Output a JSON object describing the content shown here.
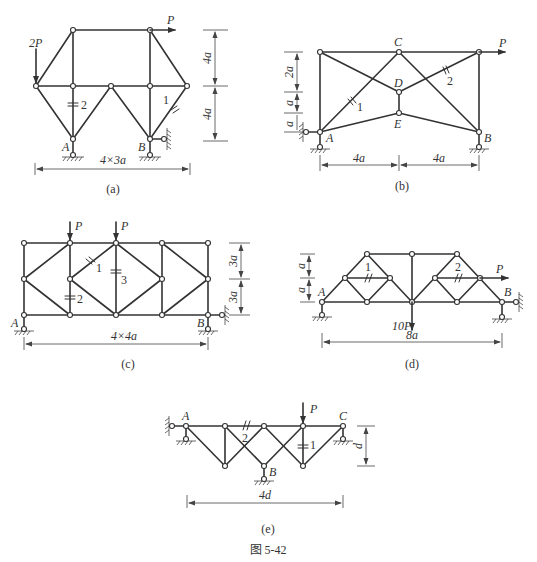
{
  "figure": {
    "caption": "图 5-42",
    "panels": [
      {
        "id": "a",
        "caption": "(a)",
        "labels": {
          "support_A": "A",
          "support_B": "B",
          "load_left": "2P",
          "load_top": "P",
          "member_1": "1",
          "member_2": "2"
        },
        "dimensions": {
          "span": "4×3a",
          "height_upper": "4a",
          "height_lower": "4a"
        }
      },
      {
        "id": "b",
        "caption": "(b)",
        "labels": {
          "support_A": "A",
          "support_B": "B",
          "node_C": "C",
          "node_D": "D",
          "node_E": "E",
          "load": "P",
          "member_1": "1",
          "member_2": "2"
        },
        "dimensions": {
          "left_span": "4a",
          "right_span": "4a",
          "h1": "2a",
          "h2": "a",
          "h3": "a"
        }
      },
      {
        "id": "c",
        "caption": "(c)",
        "labels": {
          "support_A": "A",
          "support_B": "B",
          "load_1": "P",
          "load_2": "P",
          "member_1": "1",
          "member_2": "2",
          "member_3": "3"
        },
        "dimensions": {
          "span": "4×4a",
          "h_upper": "3a",
          "h_lower": "3a"
        }
      },
      {
        "id": "d",
        "caption": "(d)",
        "labels": {
          "support_A": "A",
          "support_B": "B",
          "load_down": "10P",
          "load_right": "P",
          "member_1": "1",
          "member_2": "2"
        },
        "dimensions": {
          "span": "8a",
          "h_upper": "a",
          "h_lower": "a"
        }
      },
      {
        "id": "e",
        "caption": "(e)",
        "labels": {
          "support_A": "A",
          "support_B": "B",
          "support_C": "C",
          "load": "P",
          "member_1": "1",
          "member_2": "2"
        },
        "dimensions": {
          "span": "4d",
          "height": "d"
        }
      }
    ]
  }
}
